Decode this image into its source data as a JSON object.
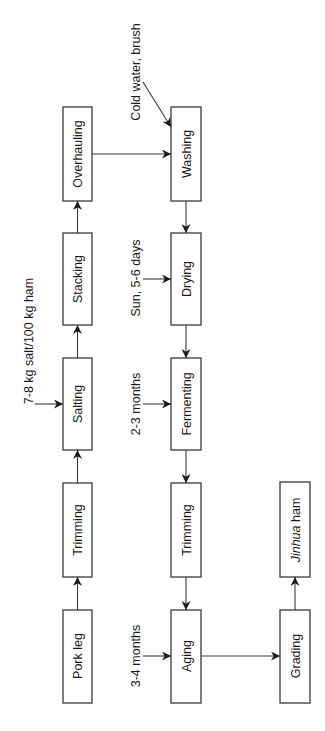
{
  "diagram": {
    "orientation": "rotated -90deg",
    "nodes": {
      "pork_leg": "Pork leg",
      "trimming1": "Trimming",
      "salting": "Salting",
      "stacking": "Stacking",
      "overhauling": "Overhauling",
      "washing": "Washing",
      "drying": "Drying",
      "fermenting": "Fermenting",
      "trimming2": "Trimming",
      "aging": "Aging",
      "grading": "Grading",
      "product_italic": "Jinhua",
      "product_rest": " ham"
    },
    "inputs": {
      "salting": "7-8 kg salt/100 kg ham",
      "washing": "Cold water, brush",
      "drying": "Sun, 5-6 days",
      "fermenting": "2-3 months",
      "aging": "3-4 months"
    },
    "edges": [
      [
        "Pork leg",
        "Trimming"
      ],
      [
        "Trimming",
        "Salting"
      ],
      [
        "Salting",
        "Stacking"
      ],
      [
        "Stacking",
        "Overhauling"
      ],
      [
        "Overhauling",
        "Washing"
      ],
      [
        "Washing",
        "Drying"
      ],
      [
        "Drying",
        "Fermenting"
      ],
      [
        "Fermenting",
        "Trimming"
      ],
      [
        "Trimming",
        "Aging"
      ],
      [
        "Aging",
        "Grading"
      ],
      [
        "Grading",
        "Jinhua ham"
      ]
    ],
    "colors": {
      "stroke": "#3a3a3a",
      "text": "#1a1a1a",
      "background": "#ffffff"
    }
  }
}
